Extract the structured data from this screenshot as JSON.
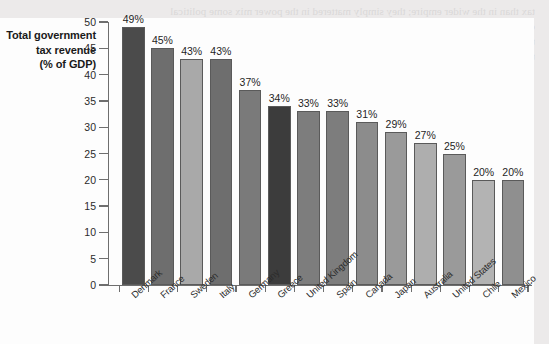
{
  "page": {
    "background_color": "#eceaea",
    "panel_color": "#fdfdfd",
    "ghost_text": [
      "tax than in the wider empire; they simply mattered in the power mix some political",
      "order; a particular state, the domestic consensus of a relation to the tax structure",
      "this data in the field in which 1979 tax did not fall into in manner the number of",
      "the year long for thinking, were more likely and they used the count's tax base."
    ],
    "ghost_text_lower": [
      "a fraction by the wide",
      "the tax burden in"
    ]
  },
  "chart_data": {
    "type": "bar",
    "title": "Total government tax revenue (% of GDP)",
    "title_lines": [
      "Total government",
      "tax revenue",
      "(% of GDP)"
    ],
    "xlabel": "",
    "ylabel": "",
    "ylim": [
      0,
      50
    ],
    "ytick_labels": [
      "0",
      "5",
      "10",
      "15",
      "20",
      "25",
      "30",
      "35",
      "40",
      "45",
      "50"
    ],
    "ytick_values": [
      0,
      5,
      10,
      15,
      20,
      25,
      30,
      35,
      40,
      45,
      50
    ],
    "grid": false,
    "legend": "none",
    "value_suffix": "%",
    "categories": [
      "Denmark",
      "France",
      "Sweden",
      "Italy",
      "Germany",
      "Greece",
      "United Kingdom",
      "Spain",
      "Canada",
      "Japan",
      "Australia",
      "United States",
      "Chile",
      "Mexico"
    ],
    "values": [
      49,
      45,
      43,
      43,
      37,
      34,
      33,
      33,
      31,
      29,
      27,
      25,
      20,
      20
    ],
    "value_labels": [
      "49%",
      "45%",
      "43%",
      "43%",
      "37%",
      "34%",
      "33%",
      "33%",
      "31%",
      "29%",
      "27%",
      "25%",
      "20%",
      "20%"
    ],
    "bar_colors": [
      "#4b4b4b",
      "#6e6e6e",
      "#a9a9a9",
      "#6e6e6e",
      "#7a7a7a",
      "#3c3c3c",
      "#7d7d7d",
      "#7d7d7d",
      "#8c8c8c",
      "#9a9a9a",
      "#aeaeae",
      "#9a9a9a",
      "#b3b3b3",
      "#8f8f8f"
    ],
    "bar_edge_color": "#5a5a5a",
    "axis_color": "#6e6e6e",
    "text_color": "#1f1f1f"
  }
}
